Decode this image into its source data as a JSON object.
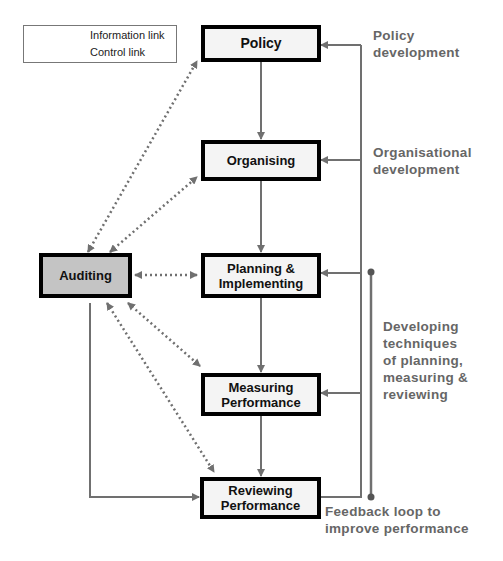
{
  "legend": {
    "information_link": "Information link",
    "control_link": "Control link"
  },
  "boxes": {
    "policy": "Policy",
    "organising": "Organising",
    "planning": "Planning &\nImplementing",
    "measuring": "Measuring\nPerformance",
    "reviewing": "Reviewing\nPerformance",
    "auditing": "Auditing"
  },
  "notes": {
    "policy_development": "Policy\ndevelopment",
    "organisational_development": "Organisational\ndevelopment",
    "developing_techniques": "Developing\ntechniques\nof planning,\nmeasuring &\nreviewing",
    "feedback_loop": "Feedback loop to\nimprove performance"
  },
  "colors": {
    "box_border": "#000000",
    "box_fill": "#f4f4f4",
    "auditing_fill": "#c4c4c4",
    "line": "#707070",
    "note_text": "#666666"
  }
}
